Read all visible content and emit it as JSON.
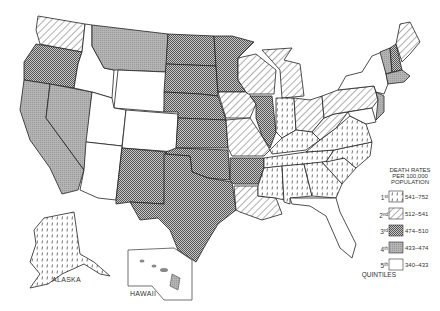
{
  "map": {
    "title": "Death rates per 100,000 population by state (quintiles)",
    "labels": {
      "alaska": "ALASKA",
      "hawaii": "HAWAII"
    },
    "colors": {
      "stroke": "#222222",
      "gray": "#a9a9a9",
      "background": "#ffffff"
    }
  },
  "legend": {
    "title_lines": [
      "DEATH RATES",
      "PER 100,000",
      "POPULATION"
    ],
    "footer": "QUINTILES",
    "items": [
      {
        "quintile": "1st",
        "num": "1",
        "sup": "st",
        "range": "541–752",
        "pattern": "dashed-vertical"
      },
      {
        "quintile": "2nd",
        "num": "2",
        "sup": "nd",
        "range": "512–541",
        "pattern": "diagonal-lines"
      },
      {
        "quintile": "3rd",
        "num": "3",
        "sup": "rd",
        "range": "474–510",
        "pattern": "crosshatch"
      },
      {
        "quintile": "4th",
        "num": "4",
        "sup": "th",
        "range": "433–474",
        "pattern": "gray-stipple"
      },
      {
        "quintile": "5th",
        "num": "5",
        "sup": "th",
        "range": "340–433",
        "pattern": "blank"
      }
    ]
  },
  "states": {
    "1st": [
      "Alaska",
      "Indiana",
      "Kentucky",
      "Tennessee",
      "Mississippi",
      "Alabama",
      "Georgia",
      "South Carolina",
      "North Carolina",
      "Virginia"
    ],
    "2nd": [
      "Washington",
      "Iowa",
      "Wisconsin",
      "Michigan",
      "Missouri",
      "Louisiana",
      "Ohio",
      "Pennsylvania",
      "West Virginia",
      "Maine"
    ],
    "3rd": [
      "Oregon",
      "North Dakota",
      "South Dakota",
      "Nebraska",
      "Kansas",
      "Minnesota",
      "Illinois",
      "New Mexico",
      "Texas",
      "Oklahoma",
      "Arkansas",
      "New Hampshire"
    ],
    "4th": [
      "California",
      "Nevada",
      "Montana",
      "Vermont",
      "Massachusetts",
      "New Jersey",
      "Hawaii"
    ],
    "5th": [
      "Idaho",
      "Wyoming",
      "Utah",
      "Colorado",
      "Arizona",
      "New York",
      "Florida"
    ]
  }
}
